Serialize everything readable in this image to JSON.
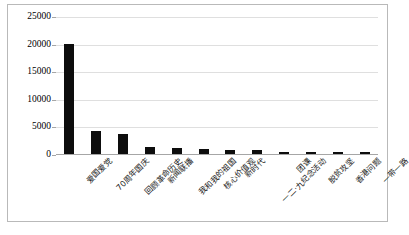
{
  "chart_data": {
    "type": "bar",
    "title": "",
    "xlabel": "",
    "ylabel": "",
    "ylim": [
      0,
      25000
    ],
    "ytick_values": [
      0,
      5000,
      10000,
      15000,
      20000,
      25000
    ],
    "ytick_labels": [
      "0",
      "5000",
      "10000",
      "15000",
      "20000",
      "25000"
    ],
    "grid": true,
    "legend": "none",
    "bar_color": "#0d0d0d",
    "categories": [
      "爱国爱党",
      "70周年国庆",
      "回顾革命历史",
      "新闻联播",
      "我和我的祖国",
      "核心价值观",
      "新时代",
      "一二·九纪念活动",
      "团课",
      "脱贫攻坚",
      "香港问题",
      "一带一路"
    ],
    "values": [
      20000,
      4100,
      3600,
      1200,
      1000,
      850,
      800,
      700,
      420,
      380,
      330,
      280
    ]
  }
}
